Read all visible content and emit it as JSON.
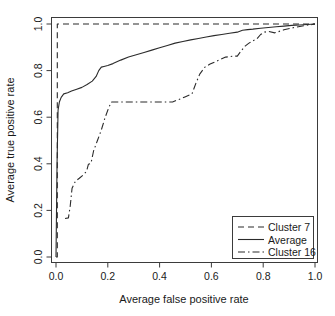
{
  "chart_data": {
    "type": "line",
    "title": "",
    "xlabel": "Average false positive rate",
    "ylabel": "Average true positive rate",
    "xlim": [
      0.0,
      1.0
    ],
    "ylim": [
      0.0,
      1.0
    ],
    "xticks": [
      "0.0",
      "0.2",
      "0.4",
      "0.6",
      "0.8",
      "1.0"
    ],
    "yticks": [
      "0.0",
      "0.2",
      "0.4",
      "0.6",
      "0.8",
      "1.0"
    ],
    "xtick_values": [
      0.0,
      0.2,
      0.4,
      0.6,
      0.8,
      1.0
    ],
    "ytick_values": [
      0.0,
      0.2,
      0.4,
      0.6,
      0.8,
      1.0
    ],
    "grid": false,
    "legend_position": "bottom-right",
    "series": [
      {
        "name": "Cluster 7",
        "style": "dashed",
        "x": [
          0.0,
          0.005,
          0.005,
          1.0
        ],
        "y": [
          0.0,
          0.0,
          1.0,
          1.0
        ]
      },
      {
        "name": "Average",
        "style": "solid",
        "x": [
          0.0,
          0.004,
          0.008,
          0.013,
          0.02,
          0.03,
          0.045,
          0.06,
          0.08,
          0.1,
          0.12,
          0.14,
          0.155,
          0.165,
          0.175,
          0.185,
          0.2,
          0.22,
          0.25,
          0.28,
          0.31,
          0.34,
          0.37,
          0.4,
          0.43,
          0.46,
          0.49,
          0.52,
          0.55,
          0.58,
          0.61,
          0.64,
          0.67,
          0.7,
          0.72,
          0.74,
          0.76,
          0.79,
          0.82,
          0.85,
          0.88,
          0.91,
          0.94,
          0.97,
          1.0
        ],
        "y": [
          0.0,
          0.4,
          0.63,
          0.665,
          0.685,
          0.7,
          0.705,
          0.712,
          0.72,
          0.728,
          0.74,
          0.755,
          0.775,
          0.8,
          0.815,
          0.818,
          0.822,
          0.83,
          0.845,
          0.858,
          0.868,
          0.878,
          0.888,
          0.898,
          0.908,
          0.918,
          0.925,
          0.932,
          0.938,
          0.944,
          0.95,
          0.955,
          0.96,
          0.965,
          0.973,
          0.976,
          0.978,
          0.982,
          0.985,
          0.988,
          0.991,
          0.994,
          0.996,
          0.998,
          1.0
        ]
      },
      {
        "name": "Cluster 16",
        "style": "dashdot",
        "x": [
          0.035,
          0.048,
          0.055,
          0.062,
          0.075,
          0.09,
          0.105,
          0.118,
          0.125,
          0.135,
          0.145,
          0.16,
          0.175,
          0.19,
          0.205,
          0.215,
          0.45,
          0.465,
          0.48,
          0.5,
          0.515,
          0.525,
          0.54,
          0.555,
          0.575,
          0.595,
          0.615,
          0.635,
          0.655,
          0.685,
          0.7,
          0.715,
          0.73,
          0.745,
          0.76,
          0.775,
          0.79,
          0.805,
          0.82,
          0.845,
          0.88,
          0.92,
          0.96,
          1.0
        ],
        "y": [
          0.165,
          0.168,
          0.22,
          0.295,
          0.325,
          0.338,
          0.352,
          0.368,
          0.398,
          0.402,
          0.455,
          0.5,
          0.545,
          0.6,
          0.645,
          0.665,
          0.665,
          0.672,
          0.678,
          0.688,
          0.695,
          0.7,
          0.745,
          0.785,
          0.815,
          0.828,
          0.838,
          0.848,
          0.858,
          0.862,
          0.862,
          0.885,
          0.905,
          0.918,
          0.928,
          0.935,
          0.955,
          0.965,
          0.968,
          0.962,
          0.975,
          0.985,
          0.993,
          1.0
        ]
      }
    ]
  },
  "legend": {
    "entries": [
      {
        "label": "Cluster 7",
        "style": "dashed"
      },
      {
        "label": "Average",
        "style": "solid"
      },
      {
        "label": "Cluster 16",
        "style": "dashdot"
      }
    ]
  }
}
